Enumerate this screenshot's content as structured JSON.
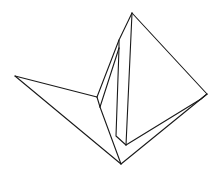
{
  "figure": {
    "description": "Line drawing of a folded paper origami shape (crane-like fold) with a tall triangular panel and a long left wing",
    "stroke_color": "#1a1a1a",
    "background": "#ffffff"
  },
  "vertices": {
    "apex": [
      132,
      13
    ],
    "right": [
      207,
      94
    ],
    "left_tip": [
      15,
      76
    ],
    "bottom": [
      121,
      164
    ],
    "inner_bottom": [
      126,
      145
    ],
    "mid_fold_a": [
      97,
      97
    ],
    "mid_fold_b": [
      100,
      107
    ],
    "upper_fold_a": [
      119,
      40
    ],
    "upper_fold_b": [
      119,
      48
    ],
    "inner_left_base": [
      116,
      136
    ],
    "right_inner": [
      201,
      99
    ]
  }
}
